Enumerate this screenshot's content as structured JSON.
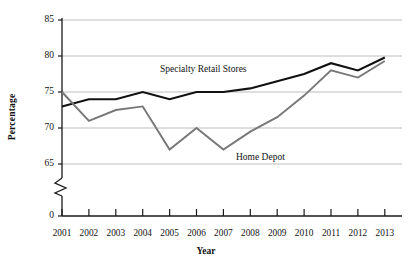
{
  "chart_data": {
    "type": "line",
    "title": "",
    "xlabel": "Year",
    "ylabel": "Percentage",
    "categories": [
      "2001",
      "2002",
      "2003",
      "2004",
      "2005",
      "2006",
      "2007",
      "2008",
      "2009",
      "2010",
      "2011",
      "2012",
      "2013"
    ],
    "x": [
      2001,
      2002,
      2003,
      2004,
      2005,
      2006,
      2007,
      2008,
      2009,
      2010,
      2011,
      2012,
      2013
    ],
    "ylim": [
      65,
      85
    ],
    "ytick_labels": [
      "85",
      "80",
      "75",
      "70",
      "65",
      "0"
    ],
    "ytick_values": [
      85,
      80,
      75,
      70,
      65,
      0
    ],
    "y_axis_break": true,
    "grid": true,
    "grid_orientation": "horizontal",
    "legend_position": "inline-annotation",
    "series": [
      {
        "name": "Specialty Retail Stores",
        "color": "#111111",
        "values": [
          73,
          74,
          74,
          75,
          74,
          75,
          75,
          75.5,
          76.5,
          77.5,
          79,
          78,
          79.8
        ]
      },
      {
        "name": "Home Depot",
        "color": "#777777",
        "values": [
          75,
          71,
          72.5,
          73,
          67,
          70,
          67,
          69.5,
          71.5,
          74.5,
          78,
          77,
          79.3
        ]
      }
    ],
    "annotations": [
      {
        "text": "Specialty Retail Stores",
        "series": "Specialty Retail Stores"
      },
      {
        "text": "Home Depot",
        "series": "Home Depot"
      }
    ]
  },
  "axes": {
    "y_title": "Percentage",
    "x_title": "Year"
  },
  "colors": {
    "specialty": "#111111",
    "home_depot": "#777777",
    "grid": "#b5b5b5",
    "axis": "#1a1a1a",
    "background": "#ffffff"
  }
}
